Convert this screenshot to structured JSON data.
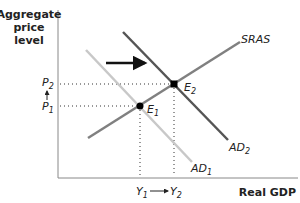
{
  "diagram": {
    "type": "AD-AS model",
    "y_axis_label": [
      "Aggregate",
      "price",
      "level"
    ],
    "x_axis_label": "Real GDP",
    "curves": [
      {
        "id": "AD1",
        "label": "AD",
        "sub": "1",
        "color": "#c8c8c8"
      },
      {
        "id": "AD2",
        "label": "AD",
        "sub": "2",
        "color": "#555555"
      },
      {
        "id": "SRAS",
        "label": "SRAS",
        "color": "#808080"
      }
    ],
    "points": [
      {
        "id": "E1",
        "label": "E",
        "sub": "1"
      },
      {
        "id": "E2",
        "label": "E",
        "sub": "2"
      }
    ],
    "price_levels": [
      {
        "label": "P",
        "sub": "2"
      },
      {
        "label": "P",
        "sub": "1"
      }
    ],
    "outputs": [
      {
        "label": "Y",
        "sub": "1"
      },
      {
        "label": "Y",
        "sub": "2"
      }
    ],
    "shift_arrow": "rightward shift of AD"
  }
}
